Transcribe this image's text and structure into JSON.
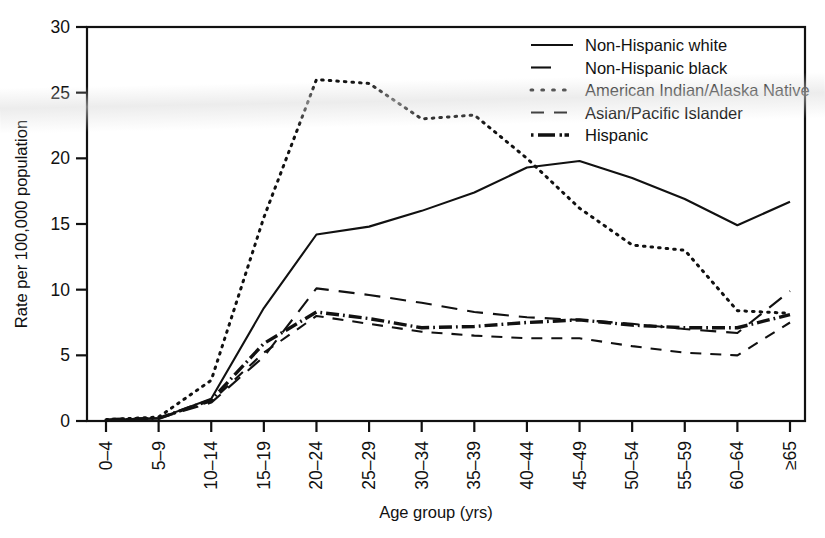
{
  "chart_data": {
    "type": "line",
    "title": "",
    "xlabel": "Age group (yrs)",
    "ylabel": "Rate per 100,000 population",
    "xlim_categories": 14,
    "ylim": [
      0,
      30
    ],
    "ytick_values": [
      0,
      5,
      10,
      15,
      20,
      25,
      30
    ],
    "ytick_labels": [
      "0",
      "5",
      "10",
      "15",
      "20",
      "25",
      "30"
    ],
    "grid": false,
    "legend_position": "top-right",
    "categories": [
      "0–4",
      "5–9",
      "10–14",
      "15–19",
      "20–24",
      "25–29",
      "30–34",
      "35–39",
      "40–44",
      "45–49",
      "50–54",
      "55–59",
      "60–64",
      "≥65"
    ],
    "series": [
      {
        "name": "Non-Hispanic white",
        "style": "solid",
        "dash": "none",
        "width": 2.1,
        "color": "#111111",
        "values": [
          0.1,
          0.2,
          1.7,
          8.6,
          14.2,
          14.8,
          16.0,
          17.4,
          19.3,
          19.8,
          18.5,
          16.9,
          14.9,
          16.7
        ]
      },
      {
        "name": "Non-Hispanic black",
        "style": "dashed",
        "dash": "11,9",
        "width": 2.1,
        "color": "#111111",
        "values": [
          0.1,
          0.2,
          1.5,
          5.2,
          8.0,
          7.4,
          6.8,
          6.5,
          6.3,
          6.3,
          5.7,
          5.2,
          5.0,
          7.5
        ]
      },
      {
        "name": "American Indian/Alaska Native",
        "style": "dotted",
        "dash": "1.6,6",
        "width": 3.0,
        "color": "#111111",
        "values": [
          0.1,
          0.3,
          3.1,
          15.5,
          26.0,
          25.7,
          23.0,
          23.3,
          20.0,
          16.2,
          13.4,
          13.0,
          8.4,
          8.2
        ]
      },
      {
        "name": "Asian/Pacific Islander",
        "style": "long-dashed",
        "dash": "16,10",
        "width": 2.1,
        "color": "#111111",
        "values": [
          0.1,
          0.2,
          1.4,
          4.9,
          10.1,
          9.6,
          9.0,
          8.3,
          7.9,
          7.7,
          7.4,
          7.0,
          6.7,
          9.9
        ]
      },
      {
        "name": "Hispanic",
        "style": "dash-dot",
        "dash": "1.8,4,13,4",
        "width": 3.4,
        "color": "#111111",
        "values": [
          0.1,
          0.2,
          1.6,
          5.9,
          8.3,
          7.8,
          7.1,
          7.2,
          7.5,
          7.7,
          7.3,
          7.1,
          7.1,
          8.1
        ]
      }
    ]
  },
  "axes": {
    "y_title": "Rate per 100,000 population",
    "x_title": "Age group (yrs)"
  },
  "legend": {
    "items": [
      {
        "label": "Non-Hispanic white",
        "sample": "solid-line-sample"
      },
      {
        "label": "Non-Hispanic black",
        "sample": "dashed-line-sample"
      },
      {
        "label": "American Indian/Alaska Native",
        "sample": "dotted-line-sample"
      },
      {
        "label": "Asian/Pacific Islander",
        "sample": "long-dashed-line-sample"
      },
      {
        "label": "Hispanic",
        "sample": "dash-dot-line-sample"
      }
    ]
  }
}
